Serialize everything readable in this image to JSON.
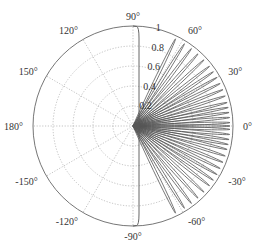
{
  "chart_data": {
    "type": "polar",
    "title": "",
    "center_px": [
      133,
      126
    ],
    "radius_px": 100,
    "rlim": [
      0,
      1
    ],
    "r_ticks": [
      0.2,
      0.4,
      0.6,
      0.8,
      1
    ],
    "r_tick_labels": [
      "0.2",
      "0.4",
      "0.6",
      "0.8",
      "1"
    ],
    "theta_ticks_deg": [
      0,
      30,
      60,
      90,
      120,
      150,
      180,
      -150,
      -120,
      -90,
      -60,
      -30
    ],
    "theta_tick_labels": [
      "0°",
      "30°",
      "60°",
      "90°",
      "120°",
      "150°",
      "180°",
      "-150°",
      "-120°",
      "-90°",
      "-60°",
      "-30°"
    ],
    "grid": true,
    "grid_style": "dotted",
    "series": [
      {
        "name": "lobes",
        "description": "Fan of narrow radial lobes reaching r≈1, spread from about -64° to +64°",
        "lobe_peak_angles_deg": [
          -64,
          -58,
          -53,
          -48,
          -43,
          -38,
          -34,
          -30,
          -26,
          -22,
          -18,
          -14,
          -11,
          -8,
          -5,
          -2,
          0,
          2,
          5,
          8,
          11,
          14,
          18,
          22,
          26,
          30,
          34,
          38,
          43,
          48,
          53,
          58,
          64
        ],
        "lobe_peak_r": 0.97,
        "lobe_half_width_deg": 1.4,
        "color": "#555555"
      },
      {
        "name": "envelope",
        "description": "Rounded envelope hugging the ±90° axis at x≈0.06, closing along the outer circle",
        "x_offset": 0.06,
        "corner_radius": 0.12,
        "color": "#555555"
      }
    ],
    "colors": {
      "curve": "#555555",
      "grid": "#9a9a9a",
      "outer_circle": "#666666",
      "text": "#333333"
    }
  }
}
